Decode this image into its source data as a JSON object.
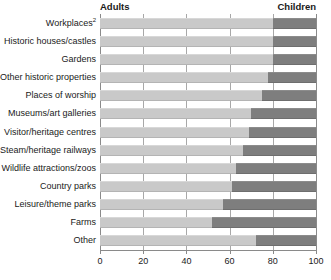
{
  "chart_data": {
    "type": "bar",
    "subtype": "stacked-horizontal-100",
    "title": "",
    "xlabel": "",
    "ylabel": "",
    "xlim": [
      0,
      100
    ],
    "xticks": [
      0,
      20,
      40,
      60,
      80,
      100
    ],
    "xtick_labels": [
      "0",
      "20",
      "40",
      "60",
      "80",
      "100"
    ],
    "grid": "vertical",
    "legend_position": "top",
    "categories": [
      "Workplaces",
      "Historic houses/castles",
      "Gardens",
      "Other historic properties",
      "Places of worship",
      "Museums/art galleries",
      "Visitor/heritage centres",
      "Steam/heritage railways",
      "Wildlife attractions/zoos",
      "Country parks",
      "Leisure/theme parks",
      "Farms",
      "Other"
    ],
    "category_footnotes": [
      "2",
      "",
      "",
      "",
      "",
      "",
      "",
      "",
      "",
      "",
      "",
      "",
      ""
    ],
    "series": [
      {
        "name": "Adults",
        "color": "#c9c9c9",
        "values": [
          80,
          80,
          80,
          78,
          75,
          70,
          69,
          66,
          63,
          61,
          57,
          52,
          72
        ]
      },
      {
        "name": "Children",
        "color": "#7e7e7e",
        "values": [
          20,
          20,
          20,
          22,
          25,
          30,
          31,
          34,
          37,
          39,
          43,
          48,
          28
        ]
      }
    ]
  },
  "legend": {
    "adults": "Adults",
    "children": "Children"
  },
  "colors": {
    "adults": "#c9c9c9",
    "children": "#7e7e7e",
    "gridline": "#a8a8a8",
    "axis": "#8a8a8a",
    "text": "#1a1a1a",
    "background": "#ffffff"
  }
}
